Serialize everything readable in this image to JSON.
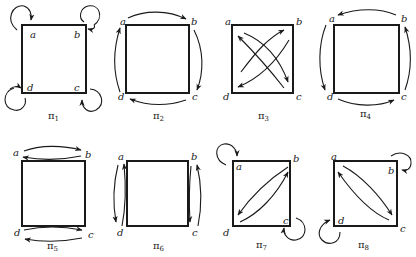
{
  "diagram": {
    "vertex_labels": [
      "a",
      "b",
      "c",
      "d"
    ],
    "panels": [
      {
        "id": "pi1",
        "caption": "π",
        "subscript": "1",
        "mapping": "identity: each vertex maps to itself (self-loops at a, b, c, d)"
      },
      {
        "id": "pi2",
        "caption": "π",
        "subscript": "2",
        "mapping": "a→b, b→c, c→d, d→a (clockwise rotation)"
      },
      {
        "id": "pi3",
        "caption": "π",
        "subscript": "3",
        "mapping": "a↔c, b↔d (diagonal swaps, 180° rotation)"
      },
      {
        "id": "pi4",
        "caption": "π",
        "subscript": "4",
        "mapping": "b→a, a→d, d→c, c→b (counter-clockwise rotation)"
      },
      {
        "id": "pi5",
        "caption": "π",
        "subscript": "5",
        "mapping": "a↔b, d↔c (horizontal reflection)"
      },
      {
        "id": "pi6",
        "caption": "π",
        "subscript": "6",
        "mapping": "a↔d, b↔c (vertical reflection)"
      },
      {
        "id": "pi7",
        "caption": "π",
        "subscript": "7",
        "mapping": "a fixed, c fixed, b↔d (diagonal reflection)"
      },
      {
        "id": "pi8",
        "caption": "π",
        "subscript": "8",
        "mapping": "b fixed, d fixed, a↔c (anti-diagonal reflection)"
      }
    ]
  }
}
